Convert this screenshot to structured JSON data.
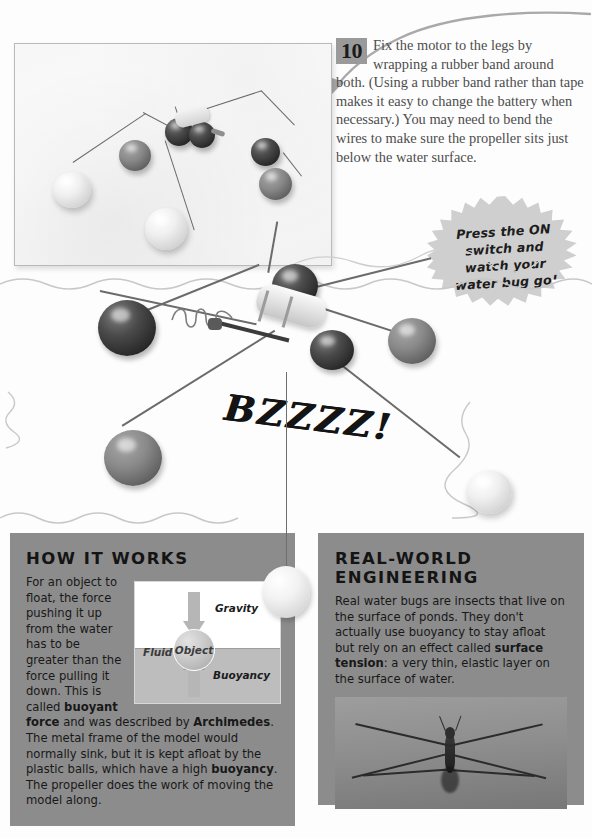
{
  "page": {
    "background_color": "#fdfdfd",
    "panel_color": "#8c8c8c",
    "accent_gray": "#9a9a9a",
    "text_color": "#1c1c1c"
  },
  "step": {
    "number": "10",
    "text": "Fix the motor to the legs by wrapping a rubber band around both. (Using a rubber band rather than tape makes it easy to change the battery when necessary.) You may need to bend the wires to make sure the propeller sits just below the water surface."
  },
  "starburst": {
    "text": "Press the ON switch and watch your water bug go!"
  },
  "sound_effect": {
    "text": "BZZZZ!"
  },
  "how_it_works": {
    "heading": "HOW IT WORKS",
    "paragraph_part1": "For an object to float, the force pushing it up from the water has to be greater than the force pulling it down. This is called ",
    "bold1": "buoyant force",
    "paragraph_part2": " and was described by ",
    "bold2": "Archimedes",
    "paragraph_part3": ". The metal frame of the model would normally sink, but it is kept afloat by the plastic balls, which have a high ",
    "bold3": "buoyancy",
    "paragraph_part4": ". The propeller does the work of moving the model along."
  },
  "diagram": {
    "gravity_label": "Gravity",
    "object_label": "Object",
    "fluid_label": "Fluid",
    "buoyancy_label": "Buoyancy"
  },
  "real_world": {
    "heading": "REAL-WORLD\nENGINEERING",
    "paragraph_part1": "Real water bugs are insects that live on the surface of ponds. They don't actually use buoyancy to stay afloat but rely on an effect called ",
    "bold1": "surface tension",
    "paragraph_part2": ": a very thin, elastic layer on the surface of water."
  },
  "photos": {
    "top_caption_alt": "water-bug-model-assembly-photo",
    "strider_caption_alt": "real-water-strider-photo"
  }
}
